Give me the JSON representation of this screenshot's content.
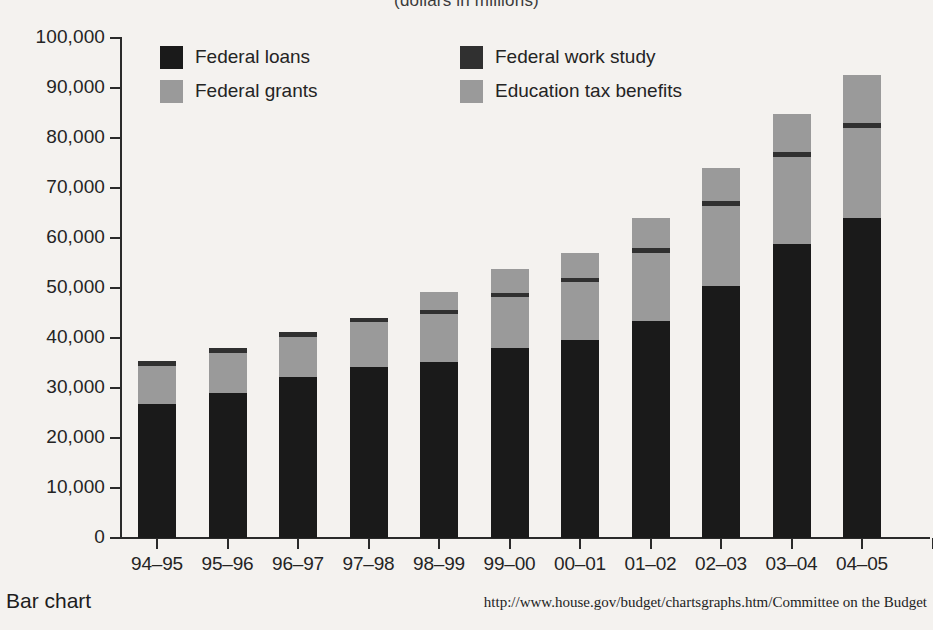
{
  "footer": {
    "left_label": "Bar chart",
    "source": "http://www.house.gov/budget/chartsgraphs.htm/Committee on the Budget"
  },
  "legend": {
    "position": "inside-top-left",
    "entries": [
      {
        "label": "Federal loans",
        "color": "#1a1a1a"
      },
      {
        "label": "Federal work study",
        "color": "#303030"
      },
      {
        "label": "Federal grants",
        "color": "#9a9a9a"
      },
      {
        "label": "Education tax benefits",
        "color": "#9a9a9a"
      }
    ]
  },
  "chart_data": {
    "type": "bar",
    "subtype": "stacked",
    "title": "(dollars in millions)",
    "xlabel": "",
    "ylabel": "",
    "ylim": [
      0,
      100000
    ],
    "ytick_values": [
      0,
      10000,
      20000,
      30000,
      40000,
      50000,
      60000,
      70000,
      80000,
      90000,
      100000
    ],
    "ytick_labels": [
      "0",
      "10,000",
      "20,000",
      "30,000",
      "40,000",
      "50,000",
      "60,000",
      "70,000",
      "80,000",
      "90,000",
      "100,000"
    ],
    "grid": false,
    "categories": [
      "94–95",
      "95–96",
      "96–97",
      "97–98",
      "98–99",
      "99–00",
      "00–01",
      "01–02",
      "02–03",
      "03–04",
      "04–05"
    ],
    "series": [
      {
        "name": "Federal loans",
        "color": "#1a1a1a",
        "values": [
          26800,
          29000,
          32300,
          34300,
          35200,
          38100,
          39700,
          43500,
          50500,
          58800,
          64000
        ]
      },
      {
        "name": "Federal grants",
        "color": "#9a9a9a",
        "values": [
          7600,
          8100,
          8000,
          9000,
          9600,
          10100,
          11500,
          13600,
          16000,
          17400,
          18000
        ]
      },
      {
        "name": "Federal work study",
        "color": "#303030",
        "values": [
          1000,
          900,
          900,
          800,
          900,
          900,
          900,
          900,
          1000,
          1000,
          1000
        ]
      },
      {
        "name": "Education tax benefits",
        "color": "#9a9a9a",
        "values": [
          0,
          0,
          0,
          0,
          3500,
          4800,
          4900,
          6000,
          6500,
          7700,
          9600
        ]
      }
    ],
    "totals": [
      35400,
      38000,
      41200,
      44100,
      49200,
      53900,
      57000,
      64000,
      74000,
      84900,
      92600
    ]
  }
}
